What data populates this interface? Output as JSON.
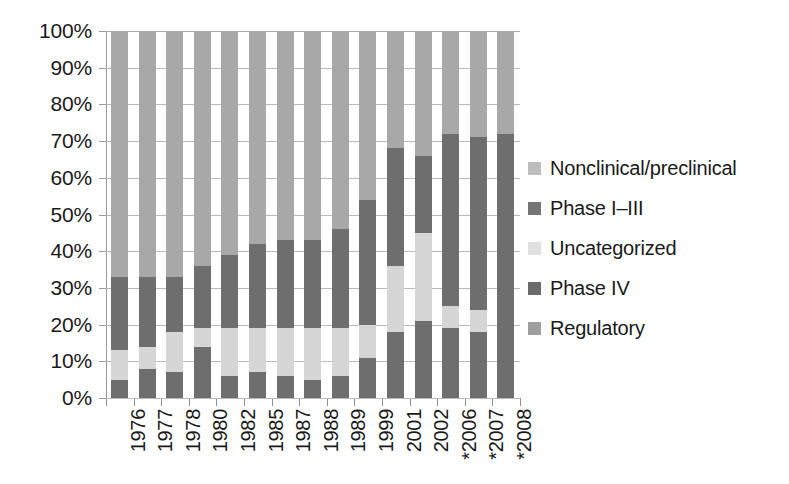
{
  "chart_data": {
    "type": "bar",
    "subtype": "stacked-bar-100-percent",
    "title": "",
    "xlabel": "",
    "ylabel": "",
    "ylim": [
      0,
      100
    ],
    "y_tick_labels": [
      "0%",
      "10%",
      "20%",
      "30%",
      "40%",
      "50%",
      "60%",
      "70%",
      "80%",
      "90%",
      "100%"
    ],
    "y_tick_values": [
      0,
      10,
      20,
      30,
      40,
      50,
      60,
      70,
      80,
      90,
      100
    ],
    "grid": true,
    "legend_position": "right",
    "categories": [
      "1976",
      "1977",
      "1978",
      "1980",
      "1982",
      "1985",
      "1987",
      "1988",
      "1989",
      "1999",
      "2001",
      "2002",
      "*2006",
      "*2007",
      "*2008"
    ],
    "stack_order_bottom_to_top": [
      "Regulatory",
      "Phase IV",
      "Phase I–III",
      "Uncategorized",
      "Nonclinical/preclinical"
    ],
    "series": [
      {
        "name": "Regulatory",
        "color": "#6e6e6e",
        "values": [
          5,
          8,
          7,
          14,
          6,
          7,
          6,
          5,
          6,
          11,
          18,
          21,
          19,
          18,
          22
        ]
      },
      {
        "name": "Phase IV",
        "color": "#d6d6d6",
        "values": [
          8,
          6,
          11,
          5,
          13,
          12,
          13,
          14,
          13,
          9,
          18,
          24,
          6,
          6,
          0
        ]
      },
      {
        "name": "Phase I–III",
        "color": "#6e6e6e",
        "values": [
          20,
          19,
          15,
          17,
          20,
          23,
          24,
          24,
          27,
          34,
          32,
          21,
          47,
          47,
          50
        ]
      },
      {
        "name": "Uncategorized",
        "color": "#e8e8e8",
        "values": [
          0,
          0,
          0,
          0,
          0,
          0,
          0,
          0,
          0,
          0,
          0,
          0,
          0,
          0,
          0
        ]
      },
      {
        "name": "Nonclinical/preclinical",
        "color": "#a8a8a8",
        "values": [
          67,
          67,
          67,
          64,
          61,
          58,
          57,
          57,
          54,
          46,
          32,
          34,
          28,
          29,
          28
        ]
      }
    ],
    "legend_entries": [
      {
        "label": "Nonclinical/preclinical",
        "color": "#bdbdbd"
      },
      {
        "label": "Phase I–III",
        "color": "#757575"
      },
      {
        "label": "Uncategorized",
        "color": "#e0e0e0"
      },
      {
        "label": "Phase IV",
        "color": "#6b6b6b"
      },
      {
        "label": "Regulatory",
        "color": "#9e9e9e"
      }
    ]
  },
  "colors": {
    "nonclinical": "#a8a8a8",
    "phase_i_iii": "#6e6e6e",
    "uncategorized": "#e8e8e8",
    "phase_iv": "#d6d6d6",
    "regulatory": "#6e6e6e",
    "gridline": "#b9b9b9",
    "axis": "#8f8f8f",
    "text": "#1a1a1a",
    "background": "#ffffff"
  }
}
